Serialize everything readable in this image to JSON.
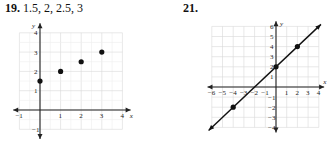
{
  "problems": [
    {
      "number": "19.",
      "answer_text": "1.5, 2, 2.5, 3"
    },
    {
      "number": "21.",
      "answer_text": ""
    }
  ],
  "chart_data": [
    {
      "type": "scatter",
      "title": "19. 1.5, 2, 2.5, 3",
      "xlabel": "x",
      "ylabel": "y",
      "xlim": [
        -1,
        4
      ],
      "ylim": [
        -1,
        4
      ],
      "grid": true,
      "xticks": [
        "-1",
        "1",
        "2",
        "3",
        "4"
      ],
      "yticks": [
        "-1",
        "1",
        "2",
        "3",
        "4"
      ],
      "points": [
        {
          "x": 0,
          "y": 1.5
        },
        {
          "x": 1,
          "y": 2
        },
        {
          "x": 2,
          "y": 2.5
        },
        {
          "x": 3,
          "y": 3
        }
      ]
    },
    {
      "type": "line",
      "title": "21.",
      "xlabel": "x",
      "ylabel": "y",
      "xlim": [
        -6,
        4
      ],
      "ylim": [
        -4,
        6
      ],
      "grid": true,
      "xticks": [
        "-6",
        "-5",
        "-4",
        "-3",
        "-2",
        "-1",
        "1",
        "2",
        "3",
        "4"
      ],
      "yticks": [
        "-4",
        "-3",
        "-2",
        "-1",
        "1",
        "2",
        "3",
        "4",
        "5",
        "6"
      ],
      "line": {
        "slope": 1,
        "intercept": 2,
        "arrows_both_ends": true
      },
      "points": [
        {
          "x": -4,
          "y": -2
        },
        {
          "x": 0,
          "y": 2
        },
        {
          "x": 2,
          "y": 4
        }
      ]
    }
  ]
}
